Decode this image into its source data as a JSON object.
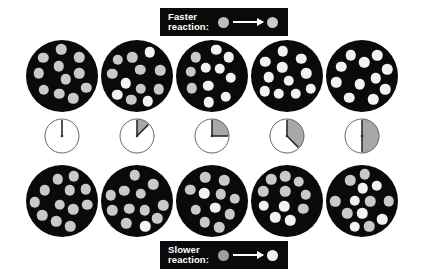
{
  "figure": {
    "background_color": "#ffffff",
    "vessel_color": "#0a0a0a",
    "reactant_color": "#c9c9c9",
    "product_color": "#f2f2f2",
    "clock_face_color": "#ffffff",
    "clock_outline_color": "#555555",
    "clock_shade_color": "#a8a8a8",
    "clock_hand_color": "#2b2b2b"
  },
  "labels": {
    "faster": {
      "text": "Faster\nreaction:",
      "reactant_color": "#bdbdbd",
      "product_color": "#c9c9c9",
      "arrow": "right-arrow"
    },
    "slower": {
      "text": "Slower\nreaction:",
      "reactant_color": "#9e9e9e",
      "product_color": "#f2f2f2",
      "arrow": "right-arrow"
    }
  },
  "chart_data": {
    "type": "diagram",
    "xlabel": "Elapsed time (clock)",
    "ylabel": "Reaction series",
    "time_steps": [
      {
        "index": 0,
        "elapsed_fraction": 0.0,
        "clock_degrees": 0,
        "clock_label": "0"
      },
      {
        "index": 1,
        "elapsed_fraction": 0.125,
        "clock_degrees": 45,
        "clock_label": "1/8"
      },
      {
        "index": 2,
        "elapsed_fraction": 0.25,
        "clock_degrees": 90,
        "clock_label": "1/4"
      },
      {
        "index": 3,
        "elapsed_fraction": 0.375,
        "clock_degrees": 135,
        "clock_label": "3/8"
      },
      {
        "index": 4,
        "elapsed_fraction": 0.5,
        "clock_degrees": 180,
        "clock_label": "1/2"
      }
    ],
    "series": [
      {
        "name": "Faster reaction",
        "row": "top",
        "total_particles": 17,
        "product_counts": [
          0,
          4,
          8,
          12,
          16
        ],
        "reactant_counts": [
          17,
          13,
          9,
          5,
          1
        ]
      },
      {
        "name": "Slower reaction",
        "row": "bottom",
        "total_particles": 17,
        "product_counts": [
          0,
          1,
          2,
          4,
          6
        ],
        "reactant_counts": [
          17,
          16,
          15,
          13,
          11
        ]
      }
    ]
  }
}
